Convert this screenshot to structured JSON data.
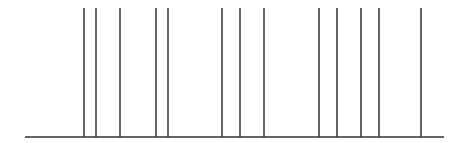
{
  "diagram": {
    "type": "event-plot",
    "line_color": "#333333",
    "background": "#ffffff",
    "baseline": {
      "x1": 25,
      "x2": 444,
      "y": 137
    },
    "line_top_y": 8,
    "events_x": [
      84,
      96,
      120,
      156,
      168,
      222,
      240,
      264,
      319,
      337,
      361,
      379,
      421
    ]
  }
}
